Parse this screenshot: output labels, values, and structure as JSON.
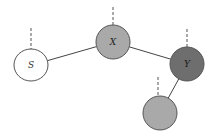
{
  "diagram": {
    "title": "",
    "nodes": [
      {
        "id": "S",
        "label": "S",
        "cx": 31,
        "cy": 65,
        "rx": 17,
        "ry": 16,
        "fill": "#ffffff",
        "label_color": "#333333"
      },
      {
        "id": "X",
        "label": "X",
        "cx": 113,
        "cy": 42,
        "rx": 17,
        "ry": 17,
        "fill": "#a9a9a9",
        "label_color": "#222222"
      },
      {
        "id": "Y",
        "label": "Y",
        "cx": 187,
        "cy": 64,
        "rx": 17,
        "ry": 17,
        "fill": "#6e6e6e",
        "label_color": "#1a1a1a"
      },
      {
        "id": "Z",
        "label": "",
        "cx": 160,
        "cy": 113,
        "rx": 17,
        "ry": 17,
        "fill": "#a9a9a9",
        "label_color": "#222222"
      }
    ],
    "edges": [
      {
        "from": "S",
        "to": "X"
      },
      {
        "from": "X",
        "to": "Y"
      },
      {
        "from": "Y",
        "to": "Z"
      }
    ],
    "dashed_stubs": [
      {
        "node": "S",
        "x": 31,
        "y1": 28,
        "y2": 49
      },
      {
        "node": "X",
        "x": 113,
        "y1": 7,
        "y2": 25
      },
      {
        "node": "Y",
        "x": 187,
        "y1": 29,
        "y2": 47
      },
      {
        "node": "Z",
        "x": 158,
        "y1": 77,
        "y2": 96
      }
    ],
    "colors": {
      "stroke": "#555555",
      "edge": "#444444",
      "dash": "#555555"
    }
  }
}
